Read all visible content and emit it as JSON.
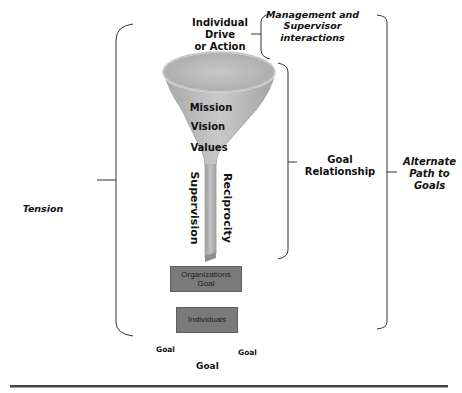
{
  "diagram": {
    "funnel_top_label": [
      "Individual",
      "Drive",
      "or Action"
    ],
    "funnel_inner_labels": [
      "Mission",
      "Vision",
      "Values"
    ],
    "stem_left_label": "Supervision",
    "stem_right_label": "Reciprocity",
    "boxes": {
      "organizations": [
        "Organizations",
        "Goal"
      ],
      "individuals": "Individuals"
    },
    "brackets": {
      "tension": "Tension",
      "management": [
        "Management and",
        "Supervisor",
        "interactions"
      ],
      "goal_relationship": [
        "Goal",
        "Relationship"
      ],
      "alternate_path": [
        "Alternate",
        "Path to",
        "Goals"
      ]
    },
    "goal_labels": {
      "left": "Goal",
      "right": "Goal",
      "center": "Goal"
    },
    "colors": {
      "funnel_fill": "#b9b9b9",
      "box_fill": "#7a7a7a",
      "bracket_stroke": "#333333",
      "rule": "#444444"
    }
  }
}
